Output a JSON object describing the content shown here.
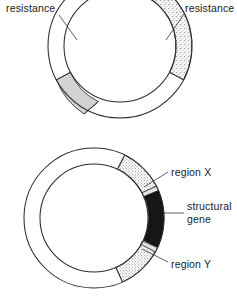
{
  "figure": {
    "background_color": "#ffffff",
    "stroke_color": "#2b2b2b",
    "width": 237,
    "height": 303
  },
  "diagrams": [
    {
      "id": "top-plasmid",
      "name": "upper-plasmid-ring",
      "center": {
        "x": 120,
        "y": 46
      },
      "outer_radius": 72,
      "inner_radius": 56,
      "segments": [
        {
          "id": "left-resistance-segment",
          "fill_style": "solid-gray",
          "fill_color": "#d0d0d0",
          "start_angle_deg": 152,
          "end_angle_deg": 240
        },
        {
          "id": "right-resistance-segment",
          "fill_style": "stipple",
          "fill_color": "#ffffff",
          "stipple_color": "#4a4a4a",
          "start_angle_deg": 300,
          "end_angle_deg": 28
        }
      ],
      "labels": [
        {
          "id": "left-resistance-label",
          "name": "label-resistance-left",
          "text": "resistance",
          "x": 6,
          "y": 11,
          "anchor": "start",
          "leader": {
            "x1": 59,
            "y1": 15,
            "x2": 76,
            "y2": 38
          }
        },
        {
          "id": "right-resistance-label",
          "name": "label-resistance-right",
          "text": "resistance",
          "x": 185,
          "y": 11,
          "anchor": "start",
          "leader": {
            "x1": 184,
            "y1": 14,
            "x2": 166,
            "y2": 38
          }
        }
      ]
    },
    {
      "id": "bottom-plasmid",
      "name": "lower-plasmid-ring",
      "center": {
        "x": 94,
        "y": 218
      },
      "outer_radius": 70,
      "inner_radius": 54,
      "segments": [
        {
          "id": "region-x-segment",
          "label": "region X",
          "fill_style": "stipple",
          "fill_color": "#ffffff",
          "stipple_color": "#4a4a4a",
          "start_angle_deg": 296,
          "end_angle_deg": 333
        },
        {
          "id": "structural-gene-segment",
          "label": "structural gene",
          "fill_style": "solid-black",
          "fill_color": "#161616",
          "start_angle_deg": 337,
          "end_angle_deg": 25
        },
        {
          "id": "region-y-segment",
          "label": "region Y",
          "fill_style": "stipple",
          "fill_color": "#ffffff",
          "stipple_color": "#4a4a4a",
          "start_angle_deg": 29,
          "end_angle_deg": 66
        }
      ],
      "labels": [
        {
          "id": "region-x-label",
          "name": "label-region-x",
          "text": "region X",
          "x": 171,
          "y": 174,
          "anchor": "start",
          "leader": {
            "x1": 168,
            "y1": 172,
            "x2": 143,
            "y2": 186
          }
        },
        {
          "id": "structural-gene-label",
          "name": "label-structural-gene",
          "line1": "structural",
          "line2": "gene",
          "x": 187,
          "y": 215,
          "anchor": "start",
          "leader": {
            "x1": 184,
            "y1": 213,
            "x2": 165,
            "y2": 213
          }
        },
        {
          "id": "region-y-label",
          "name": "label-region-y",
          "text": "region Y",
          "x": 171,
          "y": 265,
          "anchor": "start",
          "leader": {
            "x1": 168,
            "y1": 262,
            "x2": 141,
            "y2": 249
          }
        }
      ]
    }
  ]
}
